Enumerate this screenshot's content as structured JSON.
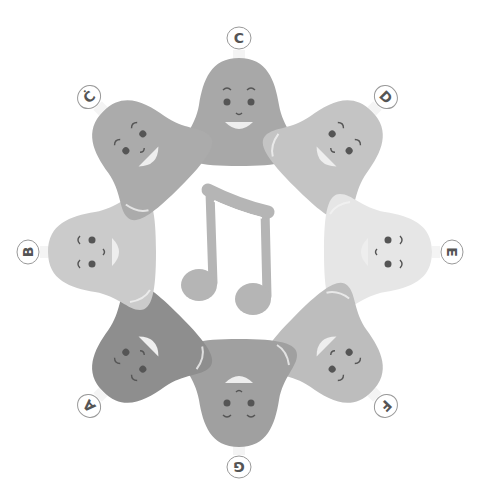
{
  "illustration": {
    "subject": "musical bell characters in a ring",
    "center_icon": "music-note-icon",
    "bells": [
      {
        "id": "c",
        "label": "C",
        "color": "#a8a8a8",
        "cx": 239,
        "cy": 110,
        "rot": 0,
        "face": "smile"
      },
      {
        "id": "d",
        "label": "D",
        "color": "#c4c4c4",
        "cx": 335,
        "cy": 148,
        "rot": 45,
        "face": "smile"
      },
      {
        "id": "e",
        "label": "E",
        "color": "#e6e6e6",
        "cx": 380,
        "cy": 252,
        "rot": 90,
        "face": "smile"
      },
      {
        "id": "f",
        "label": "F",
        "color": "#bdbdbd",
        "cx": 335,
        "cy": 355,
        "rot": 135,
        "face": "smile"
      },
      {
        "id": "g",
        "label": "G",
        "color": "#a0a0a0",
        "cx": 239,
        "cy": 395,
        "rot": 180,
        "face": "smile"
      },
      {
        "id": "a",
        "label": "A",
        "color": "#8e8e8e",
        "cx": 140,
        "cy": 355,
        "rot": 225,
        "face": "smile"
      },
      {
        "id": "b",
        "label": "B",
        "color": "#cbcbcb",
        "cx": 100,
        "cy": 252,
        "rot": 270,
        "face": "smile"
      },
      {
        "id": "c-high",
        "label": "Ċ",
        "color": "#ababab",
        "cx": 140,
        "cy": 148,
        "rot": 315,
        "face": "happy"
      }
    ],
    "note_color": "#b5b5b5"
  }
}
